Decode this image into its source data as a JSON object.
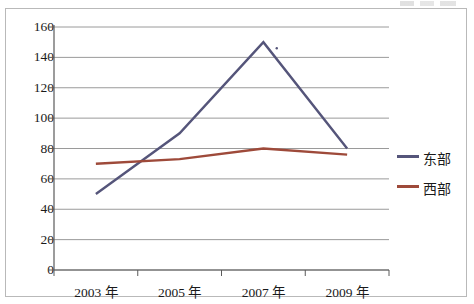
{
  "chart_data": {
    "type": "line",
    "title": "",
    "subtitle": "",
    "xlabel": "",
    "ylabel": "",
    "categories": [
      "2003 年",
      "2005 年",
      "2007 年",
      "2009 年"
    ],
    "x_tick_labels": [
      "2003 年",
      "2005 年",
      "2007 年",
      "2009 年"
    ],
    "y_tick_labels": [
      "0",
      "20",
      "40",
      "60",
      "80",
      "100",
      "120",
      "140",
      "160"
    ],
    "y_ticks": [
      0,
      20,
      40,
      60,
      80,
      100,
      120,
      140,
      160
    ],
    "ylim": [
      0,
      160
    ],
    "grid": "horizontal",
    "legend_position": "right",
    "series": [
      {
        "name": "东部",
        "color": "#55557a",
        "values": [
          50,
          90,
          150,
          80
        ]
      },
      {
        "name": "西部",
        "color": "#9e4a3a",
        "values": [
          70,
          73,
          80,
          76
        ]
      }
    ],
    "annotations": [
      {
        "name": "stray-dot",
        "x_frac": 0.665,
        "y_value": 146
      }
    ]
  },
  "legend": {
    "items": [
      {
        "label": "东部",
        "color": "#55557a"
      },
      {
        "label": "西部",
        "color": "#9e4a3a"
      }
    ]
  },
  "colors": {
    "series_east": "#55557a",
    "series_west": "#9e4a3a",
    "gridline": "#9a9a9a",
    "axis": "#5a5a5a",
    "frame": "#b9b9b9",
    "text": "#1a1a1a",
    "background": "#ffffff"
  }
}
